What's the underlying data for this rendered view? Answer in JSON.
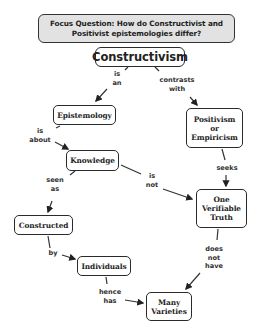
{
  "focus_question": {
    "text": "Focus Question: How do Constructivist and\nPositivist epistemologies differ?"
  },
  "concepts": {
    "constructivism": "Constructivism",
    "epistemology": "Epistemology",
    "positivism": "Positivism\nor\nEmpiricism",
    "knowledge": "Knowledge",
    "one_verifiable_truth": "One\nVerifiable\nTruth",
    "constructed": "Constructed",
    "individuals": "Individuals",
    "many_varieties": "Many\nVarieties"
  },
  "links": {
    "is_an": "is\nan",
    "contrasts_with": "contrasts\nwith",
    "is_about": "is\nabout",
    "seeks": "seeks",
    "seen_as": "seen\nas",
    "is_not": "is\nnot",
    "by": "by",
    "does_not_have": "does\nnot\nhave",
    "hence_has": "hence\nhas"
  },
  "colors": {
    "focus_bg": "#e2e2e2",
    "border": "#2a2a2a",
    "arrow": "#222222"
  }
}
